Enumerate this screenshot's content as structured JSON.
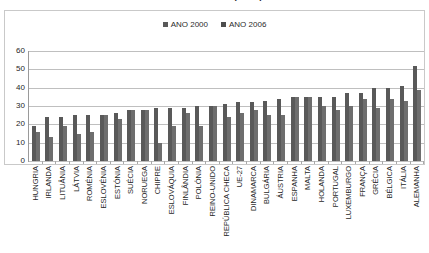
{
  "title": "das sociedades (em %)",
  "legend": {
    "position": "top-center",
    "entries": [
      {
        "label": "ANO 2000",
        "color": "#595959"
      },
      {
        "label": "ANO 2006",
        "color": "#6e6e6e"
      }
    ]
  },
  "yaxis": {
    "ticks": [
      "0",
      "10",
      "20",
      "30",
      "40",
      "50",
      "60"
    ],
    "min": 0,
    "max": 60
  },
  "chart_data": {
    "type": "bar",
    "title": "das sociedades (em %)",
    "xlabel": "",
    "ylabel": "",
    "ylim": [
      0,
      60
    ],
    "yticks": [
      0,
      10,
      20,
      30,
      40,
      50,
      60
    ],
    "grid": true,
    "legend_position": "top-center",
    "categories": [
      "HUNGRIA",
      "IRLANDA",
      "LITUÂNIA",
      "LÁTVIA",
      "ROMÉNIA",
      "ESLOVÉNIA",
      "ESTÓNIA",
      "SUÉCIA",
      "NORUEGA",
      "CHIPRE",
      "ESLOVÁQUIA",
      "FINLÂNDIA",
      "POLÓNIA",
      "REINO-UNIDO",
      "REPÚBLICA CHECA",
      "UE-27",
      "DINAMARCA",
      "BULGÁRIA",
      "ÁUSTRIA",
      "ESPANHA",
      "MALTA",
      "HOLANDA",
      "PORTUGAL",
      "LUXEMBURGO",
      "FRANÇA",
      "GRÉCIA",
      "BÉLGICA",
      "ITÁLIA",
      "ALEMANHA"
    ],
    "series": [
      {
        "name": "ANO 2000",
        "color": "#595959",
        "values": [
          19,
          24,
          24,
          25,
          25,
          25,
          26,
          28,
          28,
          29,
          29,
          29,
          30,
          30,
          31,
          32,
          32,
          33,
          34,
          35,
          35,
          35,
          35,
          37,
          37,
          40,
          40,
          41,
          52
        ]
      },
      {
        "name": "ANO 2006",
        "color": "#6e6e6e",
        "values": [
          16,
          13,
          19,
          15,
          16,
          25,
          23,
          28,
          28,
          10,
          19,
          26,
          19,
          30,
          24,
          26,
          28,
          25,
          25,
          35,
          35,
          30,
          28,
          30,
          34,
          29,
          34,
          33,
          39
        ]
      }
    ]
  }
}
